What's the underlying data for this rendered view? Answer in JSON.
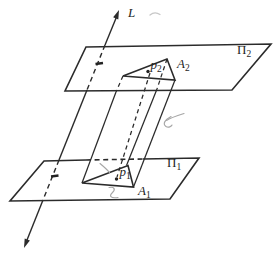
{
  "figure": {
    "type": "geometry-diagram",
    "description_visible_elements": "two parallel planes pierced by a line, triangular prism between planes",
    "ink_color": "#2b2b2b",
    "pencil_mark_color": "#a6a6a6",
    "background": "#ffffff"
  },
  "labels": {
    "line": "L",
    "plane_upper": {
      "base": "Π",
      "sub": "2"
    },
    "plane_lower": {
      "base": "Π",
      "sub": "1"
    },
    "triangle_upper": {
      "base": "A",
      "sub": "2"
    },
    "triangle_lower": {
      "base": "A",
      "sub": "1"
    },
    "point_upper": {
      "base": "p",
      "sub": "2"
    },
    "point_lower": {
      "base": "p",
      "sub": "1"
    }
  }
}
